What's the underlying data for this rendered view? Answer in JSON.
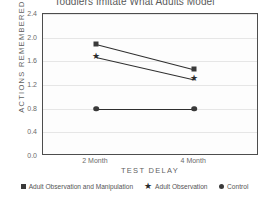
{
  "chart_data": {
    "type": "line",
    "title": "Toddlers Imitate What Adults Model",
    "xlabel": "TEST DELAY",
    "ylabel": "ACTIONS REMEMBERED",
    "categories": [
      "2 Month",
      "4 Month"
    ],
    "ylim": [
      0.0,
      2.4
    ],
    "yticks": [
      "0.0",
      "0.4",
      "0.8",
      "1.2",
      "1.6",
      "2.0",
      "2.4"
    ],
    "ytick_values": [
      0.0,
      0.4,
      0.8,
      1.2,
      1.6,
      2.0,
      2.4
    ],
    "grid": true,
    "legend_position": "bottom",
    "series": [
      {
        "name": "Adult Observation and Manipulation",
        "marker": "square",
        "values": [
          1.9,
          1.47
        ]
      },
      {
        "name": "Adult Observation",
        "marker": "star",
        "values": [
          1.68,
          1.3
        ]
      },
      {
        "name": "Control",
        "marker": "circle",
        "values": [
          0.8,
          0.8
        ]
      }
    ]
  },
  "colors": {
    "marker": "#3a3a3a",
    "line": "#2f2f2f",
    "grid": "#e6e6e6",
    "frame": "#4d4d4d",
    "text": "#5f5f5f"
  },
  "icons": {
    "star_glyph": "★"
  }
}
